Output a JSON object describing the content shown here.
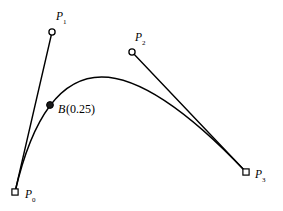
{
  "figure": {
    "kind": "cubic-bezier-construction-diagram",
    "background_color": "#ffffff",
    "stroke_color": "#000000",
    "width": 283,
    "height": 211
  },
  "chart_data": {
    "type": "line",
    "title": "",
    "subtitle": "",
    "xlabel": "",
    "ylabel": "",
    "grid": false,
    "legend": null,
    "axes_shown": false,
    "xlim": [
      0,
      283
    ],
    "ylim": [
      211,
      0
    ],
    "curve": {
      "name": "cubic-bezier",
      "degree": 3,
      "start": [
        15,
        192
      ],
      "control_1": [
        52,
        32
      ],
      "control_2": [
        132,
        52
      ],
      "end": [
        246,
        172
      ],
      "path_d": "M 15 192 C 52 32 132 52 246 172",
      "apex_approx": [
        105,
        75
      ]
    },
    "control_points": [
      {
        "id": "P0",
        "label": "P",
        "subscript": "0",
        "marker": "square-open",
        "x": 15,
        "y": 192,
        "label_x": 25,
        "label_y": 198,
        "sub_dx": 7,
        "sub_dy": 3.5
      },
      {
        "id": "P1",
        "label": "P",
        "subscript": "1",
        "marker": "circle-open",
        "x": 52,
        "y": 32,
        "label_x": 56,
        "label_y": 20,
        "sub_dx": 7,
        "sub_dy": 3.5
      },
      {
        "id": "P2",
        "label": "P",
        "subscript": "2",
        "marker": "circle-open",
        "x": 132,
        "y": 52,
        "label_x": 135,
        "label_y": 41,
        "sub_dx": 7,
        "sub_dy": 3.5
      },
      {
        "id": "P3",
        "label": "P",
        "subscript": "3",
        "marker": "square-open",
        "x": 246,
        "y": 172,
        "label_x": 255,
        "label_y": 178,
        "sub_dx": 7,
        "sub_dy": 3.5
      }
    ],
    "evaluated_point": {
      "id": "B025",
      "t": 0.25,
      "marker": "dot-filled",
      "x": 50,
      "y": 105,
      "label_italic": "B",
      "label_roman": "(0.25)",
      "label_x": 58,
      "label_y": 113,
      "roman_dx": 8
    },
    "hull_segments": [
      {
        "id": "P0-P1",
        "from": "P0",
        "to": "P1",
        "x1": 15,
        "y1": 192,
        "x2": 52,
        "y2": 32
      },
      {
        "id": "P2-P3",
        "from": "P2",
        "to": "P3",
        "x1": 132,
        "y1": 52,
        "x2": 246,
        "y2": 172
      }
    ]
  }
}
